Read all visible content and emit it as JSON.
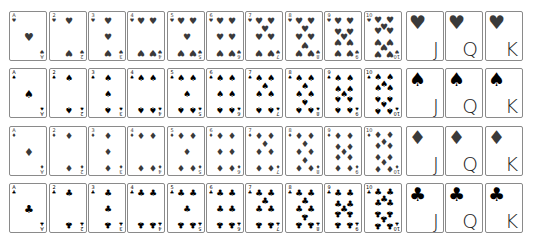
{
  "suits": [
    {
      "name": "hearts",
      "glyph": "♥",
      "color": "#3a3a3a"
    },
    {
      "name": "spades",
      "glyph": "♠",
      "color": "#000000"
    },
    {
      "name": "diamonds",
      "glyph": "♦",
      "color": "#3a3a3a"
    },
    {
      "name": "clubs",
      "glyph": "♣",
      "color": "#000000"
    }
  ],
  "ranks": [
    "A",
    "2",
    "3",
    "4",
    "5",
    "6",
    "7",
    "8",
    "9",
    "10",
    "J",
    "Q",
    "K"
  ]
}
